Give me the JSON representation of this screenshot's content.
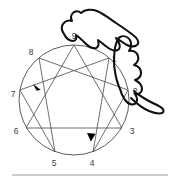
{
  "figure": {
    "doodle_name": "wing-doodle",
    "colors": {
      "stroke": "#4a4a4a",
      "circle": "#4a4a4a",
      "label": "#3a3a3a",
      "arrow": "#000000",
      "doodle": "#111111",
      "rule": "#9a9a9a",
      "background": "#ffffff"
    },
    "circle": {
      "cx": 74,
      "cy": 100,
      "r": 55
    },
    "points": [
      {
        "id": "9",
        "label": "9",
        "angle_deg": 90,
        "px": 74,
        "py": 45,
        "lx": 74,
        "ly": 39
      },
      {
        "id": "1",
        "label": "1",
        "angle_deg": 50,
        "px": 109,
        "py": 58,
        "lx": 115,
        "ly": 61
      },
      {
        "id": "2",
        "label": "2",
        "angle_deg": 10,
        "px": 128,
        "py": 90,
        "lx": 134,
        "ly": 94
      },
      {
        "id": "3",
        "label": "3",
        "angle_deg": -30,
        "px": 122,
        "py": 128,
        "lx": 131,
        "ly": 133
      },
      {
        "id": "4",
        "label": "4",
        "angle_deg": -70,
        "px": 93,
        "py": 152,
        "lx": 93,
        "ly": 164
      },
      {
        "id": "5",
        "label": "5",
        "angle_deg": -110,
        "px": 55,
        "py": 152,
        "lx": 54,
        "ly": 164
      },
      {
        "id": "6",
        "label": "6",
        "angle_deg": -150,
        "px": 26,
        "py": 128,
        "lx": 16,
        "ly": 133
      },
      {
        "id": "7",
        "label": "7",
        "angle_deg": 170,
        "px": 20,
        "py": 90,
        "lx": 12,
        "ly": 95
      },
      {
        "id": "8",
        "label": "8",
        "angle_deg": 130,
        "px": 39,
        "py": 58,
        "lx": 32,
        "ly": 54
      }
    ],
    "triangle_path": [
      "9",
      "3",
      "6",
      "9"
    ],
    "hexad_path": [
      "1",
      "4",
      "2",
      "8",
      "5",
      "7",
      "1"
    ],
    "arrows": [
      {
        "name": "arrow-toward-seven",
        "x": 38,
        "y": 86,
        "rotate_deg": 200
      },
      {
        "name": "arrow-toward-four",
        "x": 92,
        "y": 140,
        "rotate_deg": 290
      }
    ],
    "baseline_rule": {
      "x1": 12,
      "x2": 168,
      "y": 175
    }
  }
}
